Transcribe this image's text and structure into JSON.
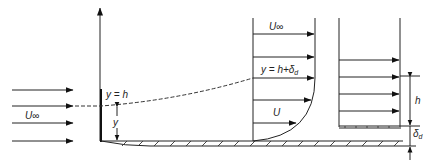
{
  "diagram": {
    "type": "boundary-layer displacement thickness schematic",
    "labels": {
      "freestream_left": "U∞",
      "freestream_profile": "U∞",
      "local_velocity": "U",
      "edge_height": "y = h",
      "displaced_height_main": "y = h+δ",
      "displaced_height_sub": "d",
      "y_dim": "y",
      "h_dim": "h",
      "delta_main": "δ",
      "delta_sub": "d"
    },
    "colors": {
      "line": "#222222",
      "background": "#ffffff"
    }
  }
}
